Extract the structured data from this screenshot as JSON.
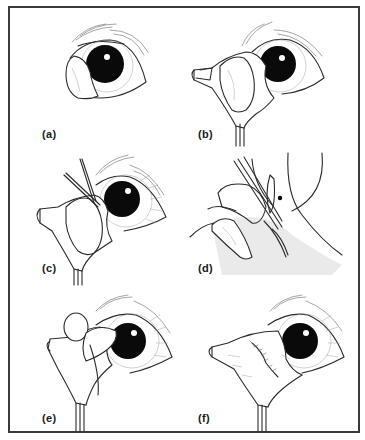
{
  "figure": {
    "border_color": "#3a3a3a",
    "panels": [
      {
        "id": "a",
        "label": "(a)",
        "content": "eye with prolapsed gland at medial canthus"
      },
      {
        "id": "b",
        "label": "(b)",
        "content": "third eyelid everted with forceps exposing gland"
      },
      {
        "id": "c",
        "label": "(c)",
        "content": "forceps/instrument inserted at gland margin"
      },
      {
        "id": "d",
        "label": "(d)",
        "content": "cross-sectional close-up of tissue with instrument"
      },
      {
        "id": "e",
        "label": "(e)",
        "content": "pocket created, gland repositioned"
      },
      {
        "id": "f",
        "label": "(f)",
        "content": "sutured closure of conjunctiva"
      }
    ]
  }
}
